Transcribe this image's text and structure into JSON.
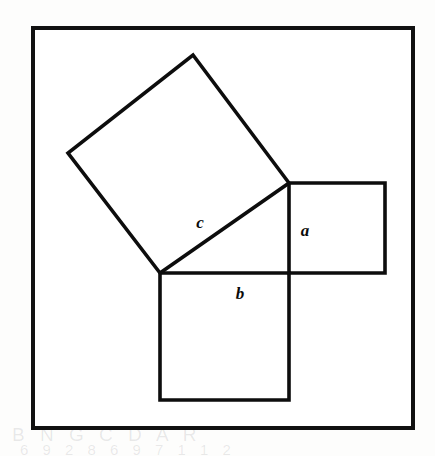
{
  "figure": {
    "grid": {
      "columns": 13,
      "rows": 13,
      "cell_width": 29.2,
      "cell_height": 30.8,
      "origin_x": 33,
      "origin_y": 28,
      "line_color": "#8a8a8a",
      "border_color": "#111111",
      "background_color": "#ffffff"
    },
    "shape_stroke_color": "#0d0d0d",
    "labels": [
      {
        "id": "label-a",
        "text": "a",
        "x": 305,
        "y": 236,
        "belongs_to": "square-a"
      },
      {
        "id": "label-b",
        "text": "b",
        "x": 240,
        "y": 299,
        "belongs_to": "square-b"
      },
      {
        "id": "label-c",
        "text": "c",
        "x": 200,
        "y": 228,
        "belongs_to": "square-c"
      }
    ],
    "shapes": [
      {
        "id": "square-a",
        "name": "square-on-leg-a",
        "side_units": 3,
        "area_units": 9,
        "points": "289,183 385,183 385,273 289,273"
      },
      {
        "id": "square-b",
        "name": "square-on-leg-b",
        "side_units": 4,
        "area_units": 16,
        "points": "160,273 289,273 289,400 160,400"
      },
      {
        "id": "square-c",
        "name": "square-on-hypotenuse-c",
        "side_units": 5,
        "area_units": 25,
        "points": "160,273 68,153 193,55 289,183"
      }
    ],
    "bleed_text": {
      "top": "s a b c d e",
      "bottom_left": "B N G   C D A R",
      "bottom": "6   9   2 8   6 9     7 1 1 2"
    }
  },
  "chart_data": {
    "type": "diagram",
    "grid_units_x": 13,
    "grid_units_y": 13,
    "triangle": {
      "vertices_units": [
        [
          4.35,
          8.0
        ],
        [
          4.35,
          5.03
        ],
        [
          7.6,
          5.03
        ]
      ],
      "leg_a_units": 3,
      "leg_b_units": 4,
      "hypotenuse_c_units": 5
    },
    "squares": [
      {
        "label": "a",
        "side": 3,
        "area": 9
      },
      {
        "label": "b",
        "side": 4,
        "area": 16
      },
      {
        "label": "c",
        "side": 5,
        "area": 25
      }
    ],
    "relation": "a^2 + b^2 = c^2  ->  9 + 16 = 25"
  }
}
